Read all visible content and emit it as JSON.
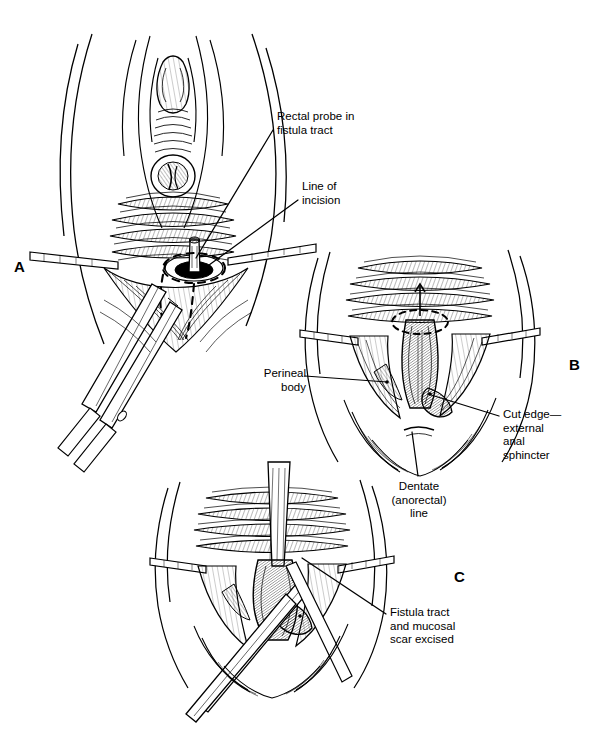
{
  "figure": {
    "background_color": "#ffffff",
    "ink_color": "#000000",
    "width": 596,
    "height": 754
  },
  "panels": [
    {
      "id": "A",
      "letter": "A",
      "letter_x": 14,
      "letter_y": 258,
      "caption": "Perineal view with rectal probe placed in the fistula tract and dashed line of planned incision; scissors begin the dissection."
    },
    {
      "id": "B",
      "letter": "B",
      "letter_x": 569,
      "letter_y": 356,
      "caption": "Perineal body divided and external anal sphincter cut edges exposed; dentate (anorectal) line visible."
    },
    {
      "id": "C",
      "letter": "C",
      "letter_x": 454,
      "letter_y": 568,
      "caption": "Fistula tract and surrounding mucosal scar excised with scissors."
    }
  ],
  "callouts": [
    {
      "name": "rectal-probe-label",
      "text": "Rectal probe in\nfistula tract",
      "align": "left",
      "x": 277,
      "y": 110,
      "leader": {
        "x1": 273,
        "y1": 130,
        "x2": 196,
        "y2": 258
      }
    },
    {
      "name": "line-of-incision-label",
      "text": "Line of\nincision",
      "align": "left",
      "x": 302,
      "y": 180,
      "leader": {
        "x1": 298,
        "y1": 200,
        "x2": 205,
        "y2": 268
      }
    },
    {
      "name": "perineal-body-label",
      "text": "Perineal\nbody",
      "align": "left",
      "x": 250,
      "y": 367,
      "leader": {
        "x1": 305,
        "y1": 376,
        "x2": 387,
        "y2": 382
      }
    },
    {
      "name": "cut-edge-sphincter-label",
      "text": "Cut edge—\nexternal\nanal\nsphincter",
      "align": "left",
      "x": 503,
      "y": 408,
      "leader": {
        "x1": 499,
        "y1": 416,
        "x2": 428,
        "y2": 394
      }
    },
    {
      "name": "dentate-line-label",
      "text": "Dentate\n(anorectal)\nline",
      "align": "center",
      "x": 390,
      "y": 480,
      "leader": {
        "x1": 418,
        "y1": 476,
        "x2": 412,
        "y2": 432
      }
    },
    {
      "name": "fistula-excised-label",
      "text": "Fistula tract\nand mucosal\nscar excised",
      "align": "left",
      "x": 390,
      "y": 606,
      "leader": {
        "x1": 386,
        "y1": 614,
        "x2": 302,
        "y2": 558
      }
    }
  ]
}
